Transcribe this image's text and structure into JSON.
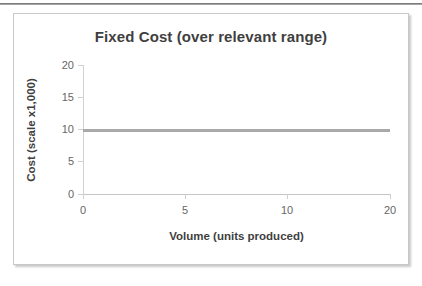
{
  "chart_data": {
    "type": "line",
    "title": "Fixed Cost (over relevant range)",
    "xlabel": "Volume (units produced)",
    "ylabel": "Cost (scale x1,000)",
    "categories": [
      "0",
      "5",
      "10",
      "20"
    ],
    "x": [
      0,
      5,
      10,
      20
    ],
    "series": [
      {
        "name": "Fixed Cost",
        "values": [
          10,
          10,
          10,
          10
        ],
        "color": "#a9a9a9"
      }
    ],
    "ylim": [
      0,
      20
    ],
    "yticks": [
      "20",
      "15",
      "10",
      "5",
      "0"
    ],
    "ytick_values": [
      20,
      15,
      10,
      5,
      0
    ],
    "xticks": [
      "0",
      "5",
      "10",
      "20"
    ],
    "grid": false,
    "legend": false,
    "legend_position": "none"
  },
  "chart": {
    "title": "Fixed Cost (over relevant range)",
    "y_axis_title": "Cost (scale x1,000)",
    "x_axis_title": "Volume (units produced)",
    "title_color": "#3f3f3f",
    "tick_label_color": "#666666",
    "series_color": "#a9a9a9",
    "axis_color": "#cfcfcf",
    "frame_color": "#c8c8c8",
    "background": "#ffffff"
  }
}
